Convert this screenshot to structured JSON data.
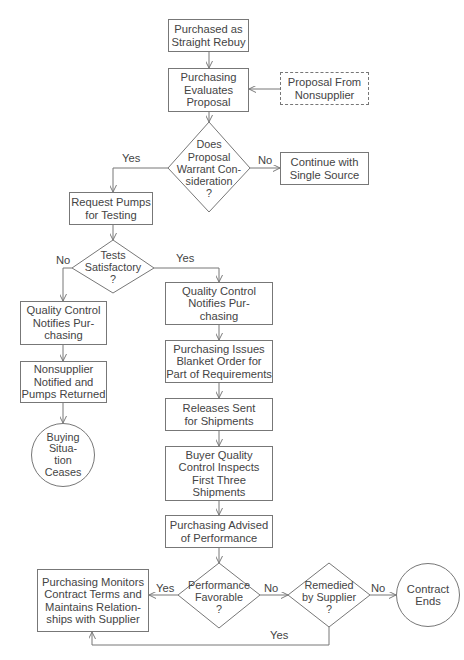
{
  "flowchart": {
    "nodes": {
      "start": "Purchased as\nStraight Rebuy",
      "evaluate": "Purchasing\nEvaluates\nProposal",
      "proposal": "Proposal From\nNonsupplier",
      "warrant": "Does\nProposal\nWarrant Con-\nsideration\n?",
      "continue": "Continue with\nSingle Source",
      "request": "Request Pumps\nfor Testing",
      "tests": "Tests\nSatisfactory\n?",
      "qc_left": "Quality Control\nNotifies Pur-\nchasing",
      "nonsupplier": "Nonsupplier\nNotified and\nPumps Returned",
      "ceases": "Buying\nSitua-\ntion\nCeases",
      "qc_right": "Quality Control\nNotifies Pur-\nchasing",
      "blanket": "Purchasing Issues\nBlanket Order for\nPart of Requirements",
      "releases": "Releases Sent\nfor Shipments",
      "inspects": "Buyer Quality\nControl Inspects\nFirst Three\nShipments",
      "advised": "Purchasing Advised\nof Performance",
      "favorable": "Performance\nFavorable\n?",
      "monitors": "Purchasing Monitors\nContract Terms and\nMaintains Relation-\nships with Supplier",
      "remedied": "Remedied\nby Supplier\n?",
      "ends": "Contract\nEnds"
    },
    "labels": {
      "warrant_yes": "Yes",
      "warrant_no": "No",
      "tests_no": "No",
      "tests_yes": "Yes",
      "favorable_yes": "Yes",
      "favorable_no": "No",
      "remedied_no": "No",
      "remedied_yes": "Yes"
    },
    "colors": {
      "line": "#777777",
      "text": "#444444",
      "background": "#ffffff"
    }
  }
}
